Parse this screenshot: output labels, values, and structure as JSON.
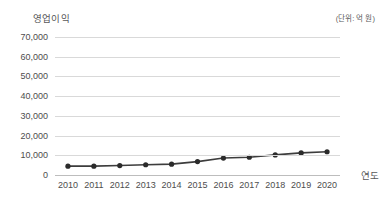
{
  "chart_data": {
    "type": "line",
    "title": "",
    "ylabel": "영업이익",
    "xlabel": "연도",
    "unit_note": "(단위: 억 원)",
    "categories": [
      "2010",
      "2011",
      "2012",
      "2013",
      "2014",
      "2015",
      "2016",
      "2017",
      "2018",
      "2019",
      "2020"
    ],
    "values": [
      4500,
      4500,
      4800,
      5200,
      5500,
      6800,
      8600,
      9000,
      10200,
      11200,
      11800
    ],
    "series": [
      {
        "name": "영업이익",
        "values": [
          4500,
          4500,
          4800,
          5200,
          5500,
          6800,
          8600,
          9000,
          10200,
          11200,
          11800
        ]
      }
    ],
    "ylim": [
      0,
      70000
    ],
    "ytick_values": [
      70000,
      60000,
      50000,
      40000,
      30000,
      20000,
      10000,
      0
    ],
    "ytick_labels": [
      "70,000",
      "60,000",
      "50,000",
      "40,000",
      "30,000",
      "20,000",
      "10,000",
      "0"
    ],
    "grid": true,
    "legend": "none",
    "marker": "circle",
    "line_color": "#3d3d3d",
    "marker_color": "#2b2b2b",
    "grid_color": "#d9d9d9",
    "text_color": "#4d4d4d",
    "background_color": "#ffffff"
  }
}
